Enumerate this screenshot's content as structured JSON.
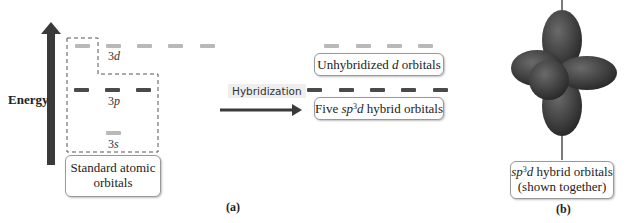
{
  "figure": {
    "panel_a_label": "(a)",
    "panel_b_label": "(b)",
    "energy_axis_label": "Energy",
    "levels": {
      "d3": {
        "label_num": "3",
        "label_letter": "d",
        "count": 5
      },
      "p3": {
        "label_num": "3",
        "label_letter": "p",
        "count": 3
      },
      "s3": {
        "label_num": "3",
        "label_letter": "s",
        "count": 1
      }
    },
    "standard_box": {
      "line1": "Standard atomic",
      "line2": "orbitals"
    },
    "process_label": "Hybridization",
    "unhybridized_box": {
      "prefix": "Unhybridized ",
      "italic": "d",
      "suffix": " orbitals",
      "count": 4
    },
    "hybrid_box": {
      "prefix": "Five ",
      "italic_sp": "sp",
      "sup": "3",
      "italic_d": "d",
      "suffix": " hybrid orbitals",
      "count": 5
    },
    "orbital_caption": {
      "italic_sp": "sp",
      "sup": "3",
      "italic_d": "d",
      "line1_suffix": " hybrid orbitals",
      "line2": "(shown together)"
    },
    "colors": {
      "arrow": "#3a3a3a",
      "light_dash": "#b9b9b9",
      "dark_dash": "#4a4a4a",
      "orbital": "#3d3d3d"
    }
  }
}
